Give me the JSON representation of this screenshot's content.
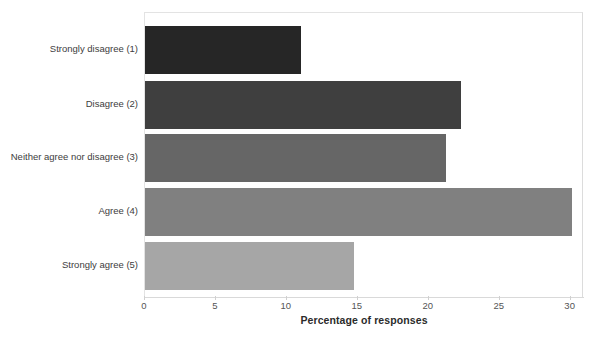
{
  "chart_data": {
    "type": "bar",
    "orientation": "horizontal",
    "title": "",
    "xlabel": "Percentage of responses",
    "ylabel": "",
    "categories": [
      "Strongly disagree (1)",
      "Disagree (2)",
      "Neither agree nor disagree (3)",
      "Agree (4)",
      "Strongly agree (5)"
    ],
    "values": [
      11.0,
      22.3,
      21.2,
      30.1,
      14.7
    ],
    "xlim": [
      0,
      30.8
    ],
    "xticks": [
      0,
      5,
      10,
      15,
      20,
      25,
      30
    ],
    "xtick_labels": [
      "0",
      "5",
      "10",
      "15",
      "20",
      "25",
      "30"
    ],
    "grid": false,
    "legend": null,
    "bar_colors": [
      "#262626",
      "#3f3f3f",
      "#666666",
      "#808080",
      "#a6a6a6"
    ],
    "plot_border_color": "#e3e3e3",
    "axis_color": "#d9d9d9",
    "text_color": "#3d3d3d"
  }
}
